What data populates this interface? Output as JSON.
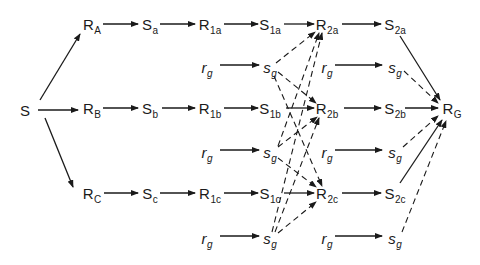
{
  "diagram": {
    "type": "stimulus-response chain diagram",
    "nodes": [
      {
        "id": "S",
        "main": "S",
        "sub": "",
        "x": 25,
        "y": 110,
        "italic": false
      },
      {
        "id": "RA",
        "main": "R",
        "sub": "A",
        "x": 92,
        "y": 26,
        "italic": false
      },
      {
        "id": "RB",
        "main": "R",
        "sub": "B",
        "x": 92,
        "y": 110,
        "italic": false
      },
      {
        "id": "RC",
        "main": "R",
        "sub": "C",
        "x": 92,
        "y": 195,
        "italic": false
      },
      {
        "id": "Sa",
        "main": "S",
        "sub": "a",
        "x": 150,
        "y": 26,
        "italic": false
      },
      {
        "id": "Sb",
        "main": "S",
        "sub": "b",
        "x": 150,
        "y": 110,
        "italic": false
      },
      {
        "id": "Sc",
        "main": "S",
        "sub": "c",
        "x": 150,
        "y": 195,
        "italic": false
      },
      {
        "id": "R1a",
        "main": "R",
        "sub": "1a",
        "x": 210,
        "y": 26,
        "italic": false
      },
      {
        "id": "R1b",
        "main": "R",
        "sub": "1b",
        "x": 210,
        "y": 110,
        "italic": false
      },
      {
        "id": "R1c",
        "main": "R",
        "sub": "1c",
        "x": 210,
        "y": 195,
        "italic": false
      },
      {
        "id": "rg1",
        "main": "r",
        "sub": "g",
        "x": 207,
        "y": 69,
        "italic": true
      },
      {
        "id": "rg2",
        "main": "r",
        "sub": "g",
        "x": 207,
        "y": 154,
        "italic": true
      },
      {
        "id": "rg3",
        "main": "r",
        "sub": "g",
        "x": 207,
        "y": 240,
        "italic": true
      },
      {
        "id": "S1a",
        "main": "S",
        "sub": "1a",
        "x": 270,
        "y": 26,
        "italic": false
      },
      {
        "id": "S1b",
        "main": "S",
        "sub": "1b",
        "x": 270,
        "y": 110,
        "italic": false
      },
      {
        "id": "S1c",
        "main": "S",
        "sub": "1c",
        "x": 270,
        "y": 195,
        "italic": false
      },
      {
        "id": "sg1",
        "main": "s",
        "sub": "g",
        "x": 270,
        "y": 69,
        "italic": true
      },
      {
        "id": "sg2",
        "main": "s",
        "sub": "g",
        "x": 270,
        "y": 154,
        "italic": true
      },
      {
        "id": "sg3",
        "main": "s",
        "sub": "g",
        "x": 270,
        "y": 240,
        "italic": true
      },
      {
        "id": "R2a",
        "main": "R",
        "sub": "2a",
        "x": 327,
        "y": 26,
        "italic": false
      },
      {
        "id": "R2b",
        "main": "R",
        "sub": "2b",
        "x": 327,
        "y": 110,
        "italic": false
      },
      {
        "id": "R2c",
        "main": "R",
        "sub": "2c",
        "x": 327,
        "y": 195,
        "italic": false
      },
      {
        "id": "rg4",
        "main": "r",
        "sub": "g",
        "x": 327,
        "y": 69,
        "italic": true
      },
      {
        "id": "rg5",
        "main": "r",
        "sub": "g",
        "x": 327,
        "y": 154,
        "italic": true
      },
      {
        "id": "rg6",
        "main": "r",
        "sub": "g",
        "x": 327,
        "y": 240,
        "italic": true
      },
      {
        "id": "S2a",
        "main": "S",
        "sub": "2a",
        "x": 395,
        "y": 26,
        "italic": false
      },
      {
        "id": "S2b",
        "main": "S",
        "sub": "2b",
        "x": 395,
        "y": 110,
        "italic": false
      },
      {
        "id": "S2c",
        "main": "S",
        "sub": "2c",
        "x": 395,
        "y": 195,
        "italic": false
      },
      {
        "id": "sg4",
        "main": "s",
        "sub": "g",
        "x": 395,
        "y": 69,
        "italic": true
      },
      {
        "id": "sg5",
        "main": "s",
        "sub": "g",
        "x": 395,
        "y": 154,
        "italic": true
      },
      {
        "id": "sg6",
        "main": "s",
        "sub": "g",
        "x": 395,
        "y": 240,
        "italic": true
      },
      {
        "id": "RG",
        "main": "R",
        "sub": "G",
        "x": 452,
        "y": 110,
        "italic": false
      }
    ],
    "edges": [
      {
        "from": "S",
        "to": "RA",
        "style": "solid",
        "x1": 40,
        "y1": 100,
        "x2": 80,
        "y2": 34
      },
      {
        "from": "S",
        "to": "RB",
        "style": "solid",
        "x1": 38,
        "y1": 110,
        "x2": 78,
        "y2": 110
      },
      {
        "from": "S",
        "to": "RC",
        "style": "solid",
        "x1": 45,
        "y1": 118,
        "x2": 73,
        "y2": 187
      },
      {
        "from": "RA",
        "to": "Sa",
        "style": "solid",
        "x1": 103,
        "y1": 24,
        "x2": 138,
        "y2": 24
      },
      {
        "from": "RB",
        "to": "Sb",
        "style": "solid",
        "x1": 103,
        "y1": 108,
        "x2": 138,
        "y2": 108
      },
      {
        "from": "RC",
        "to": "Sc",
        "style": "solid",
        "x1": 104,
        "y1": 193,
        "x2": 138,
        "y2": 193
      },
      {
        "from": "Sa",
        "to": "R1a",
        "style": "solid",
        "x1": 160,
        "y1": 24,
        "x2": 195,
        "y2": 24
      },
      {
        "from": "Sb",
        "to": "R1b",
        "style": "solid",
        "x1": 162,
        "y1": 108,
        "x2": 195,
        "y2": 108
      },
      {
        "from": "Sc",
        "to": "R1c",
        "style": "solid",
        "x1": 160,
        "y1": 193,
        "x2": 195,
        "y2": 193
      },
      {
        "from": "R1a",
        "to": "S1a",
        "style": "solid",
        "x1": 224,
        "y1": 24,
        "x2": 258,
        "y2": 24
      },
      {
        "from": "R1b",
        "to": "S1b",
        "style": "solid",
        "x1": 224,
        "y1": 108,
        "x2": 258,
        "y2": 108
      },
      {
        "from": "R1c",
        "to": "S1c",
        "style": "solid",
        "x1": 224,
        "y1": 193,
        "x2": 258,
        "y2": 193
      },
      {
        "from": "rg1",
        "to": "sg1",
        "style": "solid",
        "x1": 220,
        "y1": 65,
        "x2": 259,
        "y2": 65
      },
      {
        "from": "rg2",
        "to": "sg2",
        "style": "solid",
        "x1": 220,
        "y1": 150,
        "x2": 259,
        "y2": 150
      },
      {
        "from": "rg3",
        "to": "sg3",
        "style": "solid",
        "x1": 220,
        "y1": 236,
        "x2": 259,
        "y2": 236
      },
      {
        "from": "S1a",
        "to": "R2a",
        "style": "solid",
        "x1": 284,
        "y1": 24,
        "x2": 314,
        "y2": 24
      },
      {
        "from": "S1b",
        "to": "R2b",
        "style": "solid",
        "x1": 286,
        "y1": 108,
        "x2": 314,
        "y2": 108
      },
      {
        "from": "S1c",
        "to": "R2c",
        "style": "solid",
        "x1": 284,
        "y1": 193,
        "x2": 314,
        "y2": 193
      },
      {
        "from": "R2a",
        "to": "S2a",
        "style": "solid",
        "x1": 342,
        "y1": 24,
        "x2": 381,
        "y2": 24
      },
      {
        "from": "R2b",
        "to": "S2b",
        "style": "solid",
        "x1": 344,
        "y1": 108,
        "x2": 381,
        "y2": 108
      },
      {
        "from": "R2c",
        "to": "S2c",
        "style": "solid",
        "x1": 342,
        "y1": 193,
        "x2": 381,
        "y2": 193
      },
      {
        "from": "rg4",
        "to": "sg4",
        "style": "solid",
        "x1": 335,
        "y1": 65,
        "x2": 382,
        "y2": 65
      },
      {
        "from": "rg5",
        "to": "sg5",
        "style": "solid",
        "x1": 335,
        "y1": 150,
        "x2": 382,
        "y2": 150
      },
      {
        "from": "rg6",
        "to": "sg6",
        "style": "solid",
        "x1": 335,
        "y1": 236,
        "x2": 382,
        "y2": 236
      },
      {
        "from": "S2a",
        "to": "RG",
        "style": "solid",
        "x1": 400,
        "y1": 36,
        "x2": 440,
        "y2": 100
      },
      {
        "from": "S2b",
        "to": "RG",
        "style": "solid",
        "x1": 405,
        "y1": 108,
        "x2": 438,
        "y2": 108
      },
      {
        "from": "S2c",
        "to": "RG",
        "style": "solid",
        "x1": 400,
        "y1": 183,
        "x2": 442,
        "y2": 120
      },
      {
        "from": "sg1",
        "to": "R2a",
        "style": "dashed",
        "x1": 276,
        "y1": 63,
        "x2": 315,
        "y2": 32
      },
      {
        "from": "sg1",
        "to": "R2b",
        "style": "dashed",
        "x1": 278,
        "y1": 72,
        "x2": 316,
        "y2": 103
      },
      {
        "from": "sg1",
        "to": "R2c",
        "style": "dashed",
        "x1": 274,
        "y1": 76,
        "x2": 322,
        "y2": 186
      },
      {
        "from": "sg2",
        "to": "R2a",
        "style": "dashed",
        "x1": 278,
        "y1": 146,
        "x2": 319,
        "y2": 33
      },
      {
        "from": "sg2",
        "to": "R2b",
        "style": "dashed",
        "x1": 278,
        "y1": 147,
        "x2": 317,
        "y2": 117
      },
      {
        "from": "sg2",
        "to": "R2c",
        "style": "dashed",
        "x1": 278,
        "y1": 158,
        "x2": 316,
        "y2": 187
      },
      {
        "from": "sg3",
        "to": "R2a",
        "style": "dashed",
        "x1": 272,
        "y1": 232,
        "x2": 322,
        "y2": 33
      },
      {
        "from": "sg3",
        "to": "R2b",
        "style": "dashed",
        "x1": 275,
        "y1": 232,
        "x2": 319,
        "y2": 118
      },
      {
        "from": "sg3",
        "to": "R2c",
        "style": "dashed",
        "x1": 278,
        "y1": 233,
        "x2": 316,
        "y2": 202
      },
      {
        "from": "sg4",
        "to": "RG",
        "style": "dashed",
        "x1": 404,
        "y1": 71,
        "x2": 438,
        "y2": 103
      },
      {
        "from": "sg5",
        "to": "RG",
        "style": "dashed",
        "x1": 403,
        "y1": 147,
        "x2": 438,
        "y2": 116
      },
      {
        "from": "sg6",
        "to": "RG",
        "style": "dashed",
        "x1": 402,
        "y1": 232,
        "x2": 446,
        "y2": 121
      }
    ]
  }
}
